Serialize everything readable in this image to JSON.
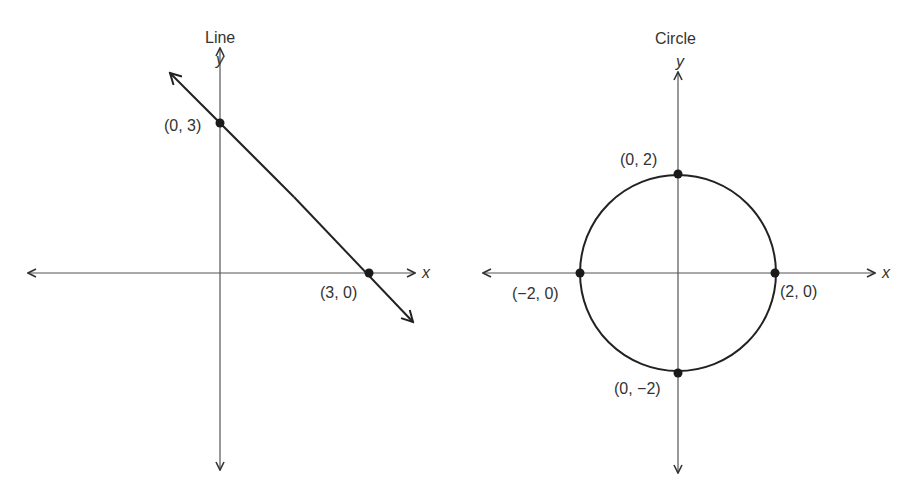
{
  "panels": [
    {
      "title": "Line",
      "x_label": "x",
      "y_label": "y",
      "points": [
        {
          "label": "(0, 3)",
          "x": 0,
          "y": 3
        },
        {
          "label": "(3, 0)",
          "x": 3,
          "y": 0
        }
      ],
      "equation_shape": "line through (0,3) and (3,0)"
    },
    {
      "title": "Circle",
      "x_label": "x",
      "y_label": "y",
      "points": [
        {
          "label": "(0, 2)",
          "x": 0,
          "y": 2
        },
        {
          "label": "(−2, 0)",
          "x": -2,
          "y": 0
        },
        {
          "label": "(2, 0)",
          "x": 2,
          "y": 0
        },
        {
          "label": "(0, −2)",
          "x": 0,
          "y": -2
        }
      ],
      "equation_shape": "circle centered at origin, radius 2"
    }
  ],
  "colors": {
    "axis": "#555555",
    "curve": "#222222",
    "text": "#333333"
  }
}
